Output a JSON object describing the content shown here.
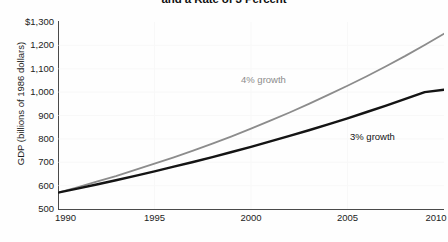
{
  "chart_data": {
    "type": "line",
    "title": "and a Rate of 3 Percent",
    "subtitle": "",
    "xlabel": "",
    "ylabel": "GDP (billions of 1986 dollars)",
    "xlim": [
      1990,
      2010
    ],
    "ylim": [
      500,
      1300
    ],
    "x_ticks": [
      "1990",
      "1995",
      "2000",
      "2005",
      "2010"
    ],
    "x_tick_values": [
      1990,
      1995,
      2000,
      2005,
      2010
    ],
    "y_ticks": [
      "500",
      "600",
      "700",
      "800",
      "900",
      "1,000",
      "1,100",
      "1,200",
      "$1,300"
    ],
    "y_tick_values": [
      500,
      600,
      700,
      800,
      900,
      1000,
      1100,
      1200,
      1300
    ],
    "grid": false,
    "legend_position": "inline-annotation",
    "x": [
      1990,
      1991,
      1992,
      1993,
      1994,
      1995,
      1996,
      1997,
      1998,
      1999,
      2000,
      2001,
      2002,
      2003,
      2004,
      2005,
      2006,
      2007,
      2008,
      2009,
      2010
    ],
    "series": [
      {
        "name": "4% growth",
        "color": "#8c8c8c",
        "values": [
          570,
          593,
          617,
          641,
          667,
          694,
          721,
          750,
          780,
          811,
          844,
          878,
          913,
          950,
          988,
          1027,
          1068,
          1111,
          1155,
          1202,
          1250
        ]
      },
      {
        "name": "3% growth",
        "color": "#141414",
        "values": [
          570,
          587,
          605,
          623,
          642,
          661,
          681,
          701,
          722,
          744,
          766,
          789,
          813,
          837,
          862,
          888,
          915,
          942,
          971,
          1000,
          1010
        ]
      }
    ],
    "annotations": [
      {
        "text": "4% growth",
        "color": "#8c8c8c"
      },
      {
        "text": "3% growth",
        "color": "#141414"
      }
    ]
  }
}
